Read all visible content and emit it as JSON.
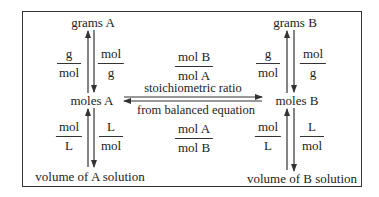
{
  "nodes": {
    "grams_a": "grams A",
    "moles_a": "moles A",
    "volume_a": "volume of A solution",
    "grams_b": "grams B",
    "moles_b": "moles B",
    "volume_b": "volume of B solution"
  },
  "conversions": {
    "a_grams_to_moles": {
      "num": "g",
      "den": "mol"
    },
    "a_moles_to_grams": {
      "num": "mol",
      "den": "g"
    },
    "a_volume_to_moles": {
      "num": "mol",
      "den": "L"
    },
    "a_moles_to_volume": {
      "num": "L",
      "den": "mol"
    },
    "b_grams_to_moles": {
      "num": "g",
      "den": "mol"
    },
    "b_moles_to_grams": {
      "num": "mol",
      "den": "g"
    },
    "b_volume_to_moles": {
      "num": "mol",
      "den": "L"
    },
    "b_moles_to_volume": {
      "num": "L",
      "den": "mol"
    },
    "a_to_b_ratio": {
      "num": "mol B",
      "den": "mol A"
    },
    "b_to_a_ratio": {
      "num": "mol A",
      "den": "mol B"
    }
  },
  "ratio_labels": {
    "top": "stoichiometric ratio",
    "bottom": "from balanced equation"
  },
  "colors": {
    "line": "#333333",
    "text": "#222222",
    "background": "#ffffff"
  }
}
